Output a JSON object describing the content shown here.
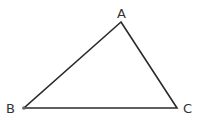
{
  "diagram": {
    "type": "triangle",
    "stroke_color": "#2a2a2a",
    "vertices": [
      {
        "label": "A",
        "x": 121,
        "y": 22
      },
      {
        "label": "B",
        "x": 24,
        "y": 108
      },
      {
        "label": "C",
        "x": 177,
        "y": 108
      }
    ],
    "edges": [
      [
        "A",
        "B"
      ],
      [
        "B",
        "C"
      ],
      [
        "C",
        "A"
      ]
    ]
  }
}
